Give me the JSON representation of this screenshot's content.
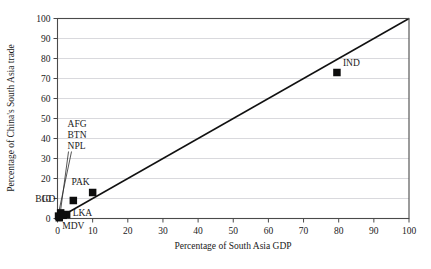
{
  "chart_data": {
    "type": "scatter",
    "title": "",
    "xlabel": "Percentage of South Asia GDP",
    "ylabel": "Percentage of China's South Asia trade",
    "xlim": [
      0,
      100
    ],
    "ylim": [
      0,
      100
    ],
    "xticks": [
      "0",
      "10",
      "20",
      "30",
      "40",
      "50",
      "60",
      "70",
      "80",
      "90",
      "100"
    ],
    "yticks": [
      "0",
      "10",
      "20",
      "30",
      "40",
      "50",
      "60",
      "70",
      "80",
      "90",
      "100"
    ],
    "grid": "horizontal",
    "legend": "none",
    "points": [
      {
        "label": "IND",
        "x": 79.5,
        "y": 73,
        "label_dx": 4,
        "label_dy": -7,
        "leader": false
      },
      {
        "label": "PAK",
        "x": 10,
        "y": 13,
        "label_dx": -1,
        "label_dy": -8,
        "leader": false
      },
      {
        "label": "BGD",
        "x": 4.5,
        "y": 9,
        "label_dx": -16,
        "label_dy": 1,
        "leader": false
      },
      {
        "label": "LKA",
        "x": 2.6,
        "y": 2,
        "label_dx": 4,
        "label_dy": 1,
        "leader": false
      },
      {
        "label": "MDV",
        "x": 0.5,
        "y": 0.4,
        "label_dx": 1,
        "label_dy": 11,
        "leader": false
      },
      {
        "label": "AFG",
        "x": 0.9,
        "y": 2.8,
        "label_dx": 0,
        "label_dy": 0,
        "leader": true
      },
      {
        "label": "BTN",
        "x": 0.3,
        "y": 1.2,
        "label_dx": 0,
        "label_dy": 0,
        "leader": true
      },
      {
        "label": "NPL",
        "x": 1.6,
        "y": 1.6,
        "label_dx": 0,
        "label_dy": 0,
        "leader": true
      }
    ],
    "callout_labels": [
      "AFG",
      "BTN",
      "NPL"
    ],
    "callout_anchor": {
      "x": 2.0,
      "y": 46
    },
    "reference_line": {
      "name": "45-degree parity line",
      "from": [
        0,
        0
      ],
      "to": [
        100,
        100
      ]
    },
    "annotations": []
  },
  "colors": {
    "marker": "#0d0d0d",
    "reference_line": "#111111",
    "gridline": "#c8c8cf",
    "frame": "#4a4a4a",
    "background": "#ffffff",
    "text": "#1a1a1a"
  }
}
